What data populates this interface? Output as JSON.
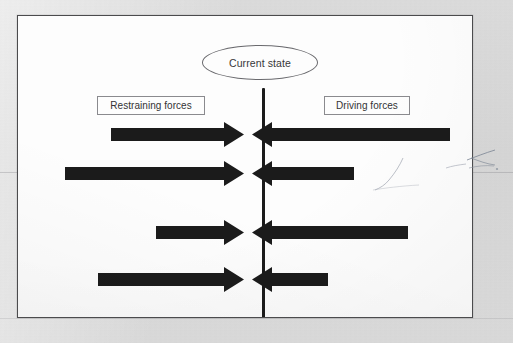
{
  "diagram": {
    "center_node": {
      "label": "Current state",
      "shape": "ellipse"
    },
    "left_label": "Restraining forces",
    "right_label": "Driving forces",
    "colors": {
      "arrow_fill": "#1b1b1b",
      "divider": "#1b1b1b",
      "frame_border": "#4b4b4d",
      "page_background": "#fdfdfd",
      "scan_background": "#d9d9d9",
      "text": "#333335",
      "box_border": "#8a8a8e",
      "ellipse_border": "#6a6a6e"
    },
    "restraining_arrows": [
      {
        "name": "restraining-arrow-1",
        "direction": "right",
        "length": 133,
        "row": 1
      },
      {
        "name": "restraining-arrow-2",
        "direction": "right",
        "length": 179,
        "row": 2
      },
      {
        "name": "restraining-arrow-3",
        "direction": "right",
        "length": 88,
        "row": 3
      },
      {
        "name": "restraining-arrow-4",
        "direction": "right",
        "length": 146,
        "row": 4
      }
    ],
    "driving_arrows": [
      {
        "name": "driving-arrow-1",
        "direction": "left",
        "length": 198,
        "row": 1
      },
      {
        "name": "driving-arrow-2",
        "direction": "left",
        "length": 102,
        "row": 2
      },
      {
        "name": "driving-arrow-3",
        "direction": "left",
        "length": 156,
        "row": 3
      },
      {
        "name": "driving-arrow-4",
        "direction": "left",
        "length": 76,
        "row": 4
      }
    ]
  }
}
